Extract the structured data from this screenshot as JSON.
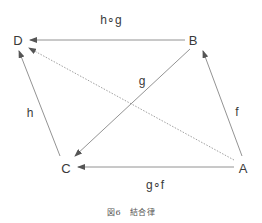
{
  "figure": {
    "caption": "図6　結合律",
    "colors": {
      "edge": "#666666",
      "text": "#3a3a3a"
    },
    "nodes": [
      {
        "id": "D",
        "label": "D",
        "x": 18,
        "y": 40
      },
      {
        "id": "B",
        "label": "B",
        "x": 193,
        "y": 40
      },
      {
        "id": "C",
        "label": "C",
        "x": 66,
        "y": 167
      },
      {
        "id": "A",
        "label": "A",
        "x": 242,
        "y": 167
      }
    ],
    "edges": [
      {
        "id": "hg",
        "from": "B",
        "to": "D",
        "label": "h∘g",
        "style": "solid"
      },
      {
        "id": "g",
        "from": "B",
        "to": "C",
        "label": "g",
        "style": "solid"
      },
      {
        "id": "h",
        "from": "C",
        "to": "D",
        "label": "h",
        "style": "solid"
      },
      {
        "id": "f",
        "from": "A",
        "to": "B",
        "label": "f",
        "style": "solid"
      },
      {
        "id": "gf",
        "from": "A",
        "to": "C",
        "label": "g∘f",
        "style": "solid"
      },
      {
        "id": "hgf",
        "from": "A",
        "to": "D",
        "label": "",
        "style": "dotted"
      }
    ],
    "edge_labels": {
      "hg": {
        "text": "h∘g",
        "x": 111,
        "y": 20
      },
      "g": {
        "text": "g",
        "x": 142,
        "y": 81
      },
      "h": {
        "text": "h",
        "x": 30,
        "y": 113
      },
      "f": {
        "text": "f",
        "x": 236,
        "y": 112
      },
      "gf": {
        "text": "g∘f",
        "x": 155,
        "y": 185
      }
    }
  }
}
